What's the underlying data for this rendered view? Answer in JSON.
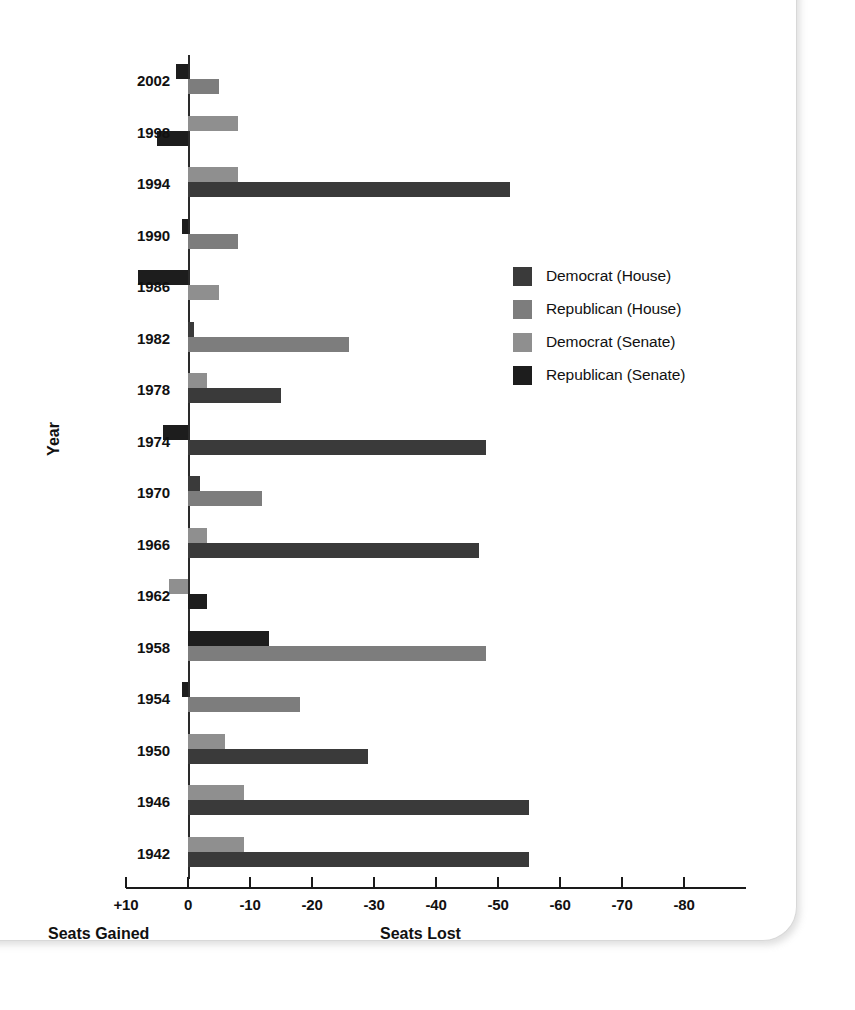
{
  "chart_data": {
    "type": "bar",
    "title": "",
    "orientation": "horizontal",
    "xlabel": "",
    "ylabel": "Year",
    "xlim": [
      10,
      -80
    ],
    "x_tick_labels": [
      "+10",
      "0",
      "-10",
      "-20",
      "-30",
      "-40",
      "-50",
      "-60",
      "-70",
      "-80"
    ],
    "x_tick_values": [
      10,
      0,
      -10,
      -20,
      -30,
      -40,
      -50,
      -60,
      -70,
      -80
    ],
    "grid": false,
    "left_caption": "Seats Gained",
    "right_caption": "Seats Lost",
    "legend_position": "center-right",
    "categories": [
      2002,
      1998,
      1994,
      1990,
      1986,
      1982,
      1978,
      1974,
      1970,
      1966,
      1962,
      1958,
      1954,
      1950,
      1946,
      1942
    ],
    "category_labels": [
      "2002",
      "1998",
      "1994",
      "1990",
      "1986",
      "1982",
      "1978",
      "1974",
      "1970",
      "1966",
      "1962",
      "1958",
      "1954",
      "1950",
      "1946",
      "1942"
    ],
    "series": [
      {
        "name": "Democrat (House)",
        "color": "#3a3a3a",
        "values": [
          null,
          null,
          -52,
          null,
          null,
          -1,
          -15,
          -48,
          -2,
          -47,
          null,
          null,
          null,
          -29,
          -55,
          -55
        ]
      },
      {
        "name": "Republican (House)",
        "color": "#7d7d7d",
        "values": [
          -5,
          null,
          null,
          -8,
          null,
          -26,
          null,
          null,
          -12,
          null,
          null,
          -48,
          -18,
          null,
          null,
          null
        ]
      },
      {
        "name": "Democrat (Senate)",
        "color": "#8f8f8f",
        "values": [
          null,
          -8,
          -8,
          null,
          -5,
          null,
          -3,
          null,
          null,
          -3,
          3,
          null,
          null,
          -6,
          -9,
          -9
        ]
      },
      {
        "name": "Republican (Senate)",
        "color": "#1d1d1d",
        "values": [
          2,
          5,
          null,
          1,
          8,
          null,
          null,
          4,
          null,
          null,
          -3,
          -13,
          1,
          null,
          null,
          null
        ]
      }
    ],
    "bars": [
      {
        "year": "2002",
        "series": "Republican (Senate)",
        "value": 2,
        "color": "#1d1d1d",
        "row": 0
      },
      {
        "year": "2002",
        "series": "Republican (House)",
        "value": -5,
        "color": "#7d7d7d",
        "row": 1
      },
      {
        "year": "1998",
        "series": "Democrat (Senate)",
        "value": -8,
        "color": "#8f8f8f",
        "row": 0
      },
      {
        "year": "1998",
        "series": "Republican (Senate)",
        "value": 5,
        "color": "#1d1d1d",
        "row": 1
      },
      {
        "year": "1994",
        "series": "Democrat (Senate)",
        "value": -8,
        "color": "#8f8f8f",
        "row": 0
      },
      {
        "year": "1994",
        "series": "Democrat (House)",
        "value": -52,
        "color": "#3a3a3a",
        "row": 1
      },
      {
        "year": "1990",
        "series": "Republican (Senate)",
        "value": 1,
        "color": "#1d1d1d",
        "row": 0
      },
      {
        "year": "1990",
        "series": "Republican (House)",
        "value": -8,
        "color": "#7d7d7d",
        "row": 1
      },
      {
        "year": "1986",
        "series": "Republican (Senate)",
        "value": 8,
        "color": "#1d1d1d",
        "row": 0
      },
      {
        "year": "1986",
        "series": "Democrat (Senate)",
        "value": -5,
        "color": "#8f8f8f",
        "row": 1
      },
      {
        "year": "1982",
        "series": "Democrat (House)",
        "value": -1,
        "color": "#3a3a3a",
        "row": 0
      },
      {
        "year": "1982",
        "series": "Republican (House)",
        "value": -26,
        "color": "#7d7d7d",
        "row": 1
      },
      {
        "year": "1978",
        "series": "Democrat (Senate)",
        "value": -3,
        "color": "#8f8f8f",
        "row": 0
      },
      {
        "year": "1978",
        "series": "Democrat (House)",
        "value": -15,
        "color": "#3a3a3a",
        "row": 1
      },
      {
        "year": "1974",
        "series": "Republican (Senate)",
        "value": 4,
        "color": "#1d1d1d",
        "row": 0
      },
      {
        "year": "1974",
        "series": "Democrat (House)",
        "value": -48,
        "color": "#3a3a3a",
        "row": 1
      },
      {
        "year": "1970",
        "series": "Democrat (House)",
        "value": -2,
        "color": "#3a3a3a",
        "row": 0
      },
      {
        "year": "1970",
        "series": "Republican (House)",
        "value": -12,
        "color": "#7d7d7d",
        "row": 1
      },
      {
        "year": "1966",
        "series": "Democrat (Senate)",
        "value": -3,
        "color": "#8f8f8f",
        "row": 0
      },
      {
        "year": "1966",
        "series": "Democrat (House)",
        "value": -47,
        "color": "#3a3a3a",
        "row": 1
      },
      {
        "year": "1962",
        "series": "Democrat (Senate)",
        "value": 3,
        "color": "#8f8f8f",
        "row": 0
      },
      {
        "year": "1962",
        "series": "Republican (Senate)",
        "value": -3,
        "color": "#1d1d1d",
        "row": 1
      },
      {
        "year": "1958",
        "series": "Republican (Senate)",
        "value": -13,
        "color": "#1d1d1d",
        "row": 0
      },
      {
        "year": "1958",
        "series": "Republican (House)",
        "value": -48,
        "color": "#7d7d7d",
        "row": 1
      },
      {
        "year": "1954",
        "series": "Republican (Senate)",
        "value": 1,
        "color": "#1d1d1d",
        "row": 0
      },
      {
        "year": "1954",
        "series": "Republican (House)",
        "value": -18,
        "color": "#7d7d7d",
        "row": 1
      },
      {
        "year": "1950",
        "series": "Democrat (Senate)",
        "value": -6,
        "color": "#8f8f8f",
        "row": 0
      },
      {
        "year": "1950",
        "series": "Democrat (House)",
        "value": -29,
        "color": "#3a3a3a",
        "row": 1
      },
      {
        "year": "1946",
        "series": "Democrat (Senate)",
        "value": -9,
        "color": "#8f8f8f",
        "row": 0
      },
      {
        "year": "1946",
        "series": "Democrat (House)",
        "value": -55,
        "color": "#3a3a3a",
        "row": 1
      },
      {
        "year": "1942",
        "series": "Democrat (Senate)",
        "value": -9,
        "color": "#8f8f8f",
        "row": 0
      },
      {
        "year": "1942",
        "series": "Democrat (House)",
        "value": -55,
        "color": "#3a3a3a",
        "row": 1
      }
    ]
  },
  "legend": {
    "items": [
      {
        "label": "Democrat (House)",
        "color": "#3a3a3a",
        "class": "dem-house"
      },
      {
        "label": "Republican (House)",
        "color": "#7d7d7d",
        "class": "rep-house"
      },
      {
        "label": "Democrat (Senate)",
        "color": "#8f8f8f",
        "class": "dem-senate"
      },
      {
        "label": "Republican (Senate)",
        "color": "#1d1d1d",
        "class": "rep-senate"
      }
    ]
  }
}
